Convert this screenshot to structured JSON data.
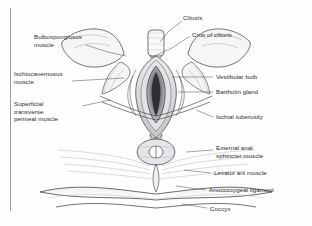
{
  "figure": {
    "type": "anatomical-illustration",
    "style": "grayscale pen-and-ink line art with stippled shading",
    "background_color": "#fefefe",
    "ink_color": "#2b2b2b",
    "shade_color": "#b9b9bd",
    "border": {
      "side": "left",
      "color": "#9a9a9a",
      "width_px": 1
    }
  },
  "labels": {
    "left": [
      {
        "id": "bulbospongiosus",
        "text": "Bulbospongiosus\nmuscle",
        "x": 34,
        "y": 33
      },
      {
        "id": "ischiocavernosus",
        "text": "Ischiocavernosus\nmuscle",
        "x": 14,
        "y": 70
      },
      {
        "id": "superficial-transverse-perineal",
        "text": "Superficial\ntransverse\nperineal muscle",
        "x": 14,
        "y": 100
      }
    ],
    "right": [
      {
        "id": "clitoris",
        "text": "Clitoris",
        "x": 183,
        "y": 14
      },
      {
        "id": "crus-of-clitoris",
        "text": "Crus of clitoris",
        "x": 192,
        "y": 31
      },
      {
        "id": "vestibular-bulb",
        "text": "Vestibular bulb",
        "x": 215,
        "y": 73
      },
      {
        "id": "bartholin-gland",
        "text": "Bartholin gland",
        "x": 215,
        "y": 88
      },
      {
        "id": "ischial-tuberosity",
        "text": "Ischial tuberosity",
        "x": 215,
        "y": 113
      },
      {
        "id": "external-anal-sphincter",
        "text": "External anal\nsphincter muscle",
        "x": 215,
        "y": 144
      },
      {
        "id": "levator-ani",
        "text": "Levator ani muscle",
        "x": 213,
        "y": 169
      },
      {
        "id": "anococcygeal-ligament",
        "text": "Anococcygeal ligament",
        "x": 208,
        "y": 186
      },
      {
        "id": "coccyx",
        "text": "Coccyx",
        "x": 209,
        "y": 205
      }
    ]
  }
}
